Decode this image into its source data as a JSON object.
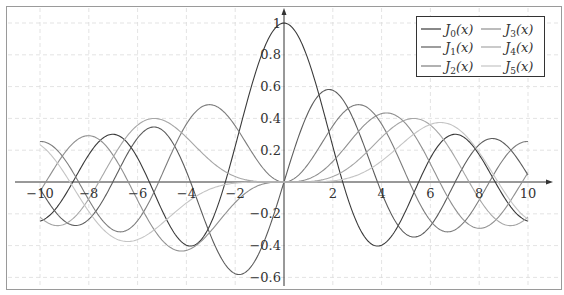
{
  "chart_data": {
    "type": "line",
    "title": "",
    "xlabel": "",
    "ylabel": "",
    "xlim": [
      -10,
      10
    ],
    "ylim": [
      -0.6,
      1
    ],
    "grid": true,
    "grid_style": "dashed",
    "legend_position": "top-right",
    "x_ticks": [
      -10,
      -8,
      -6,
      -4,
      -2,
      2,
      4,
      6,
      8,
      10
    ],
    "x_tick_labels": [
      "−10",
      "−8",
      "−6",
      "−4",
      "−2",
      "2",
      "4",
      "6",
      "8",
      "10"
    ],
    "y_ticks": [
      -0.6,
      -0.4,
      -0.2,
      0.2,
      0.4,
      0.6,
      0.8,
      1
    ],
    "y_tick_labels": [
      "−0.6",
      "−0.4",
      "−0.2",
      "0.2",
      "0.4",
      "0.6",
      "0.8",
      "1"
    ],
    "x": [
      0,
      1,
      2,
      3,
      4,
      5,
      6,
      7,
      8,
      9,
      10
    ],
    "series": [
      {
        "name": "J0(x)",
        "order": 0,
        "color": "#3a3a3a",
        "values": [
          1,
          0.7652,
          0.2239,
          -0.2601,
          -0.3971,
          -0.1776,
          0.1506,
          0.3001,
          0.1717,
          -0.0903,
          -0.2459
        ]
      },
      {
        "name": "J1(x)",
        "order": 1,
        "color": "#5c5c5c",
        "values": [
          0,
          0.4401,
          0.5767,
          0.3391,
          -0.066,
          -0.3276,
          -0.2767,
          -0.0047,
          0.2346,
          0.2453,
          0.0435
        ]
      },
      {
        "name": "J2(x)",
        "order": 2,
        "color": "#7d7d7d",
        "values": [
          0,
          0.1149,
          0.3528,
          0.4861,
          0.3641,
          0.0466,
          -0.2429,
          -0.3014,
          -0.113,
          0.1448,
          0.2546
        ]
      },
      {
        "name": "J3(x)",
        "order": 3,
        "color": "#909090",
        "values": [
          0,
          0.0196,
          0.1289,
          0.3091,
          0.4302,
          0.3648,
          0.1148,
          -0.1676,
          -0.2911,
          -0.1809,
          0.0584
        ]
      },
      {
        "name": "J4(x)",
        "order": 4,
        "color": "#a6a6a6",
        "values": [
          0,
          0.0025,
          0.034,
          0.132,
          0.2811,
          0.3912,
          0.3576,
          0.1578,
          -0.1054,
          -0.2655,
          -0.2196
        ]
      },
      {
        "name": "J5(x)",
        "order": 5,
        "color": "#c4c4c4",
        "values": [
          0,
          0.0002,
          0.007,
          0.043,
          0.1321,
          0.2611,
          0.3621,
          0.3479,
          0.1858,
          -0.055,
          -0.2341
        ]
      }
    ],
    "symmetry_note_values_for_negative_x": "J_n(-x) = (-1)^n J_n(x)"
  },
  "legend": {
    "items": [
      {
        "base": "J",
        "sub": "0",
        "arg": "(x)"
      },
      {
        "base": "J",
        "sub": "1",
        "arg": "(x)"
      },
      {
        "base": "J",
        "sub": "2",
        "arg": "(x)"
      },
      {
        "base": "J",
        "sub": "3",
        "arg": "(x)"
      },
      {
        "base": "J",
        "sub": "4",
        "arg": "(x)"
      },
      {
        "base": "J",
        "sub": "5",
        "arg": "(x)"
      }
    ]
  }
}
